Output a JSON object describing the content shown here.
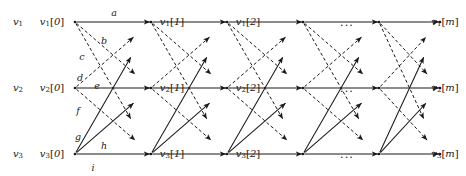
{
  "figure": {
    "type": "trellis-graph",
    "width": 466,
    "height": 176,
    "background": "#ffffff",
    "ink": "#1a1a1a"
  },
  "rows": [
    {
      "id": "v1",
      "y": 22,
      "name_label": "v",
      "name_sub": "1"
    },
    {
      "id": "v2",
      "y": 88,
      "name_label": "v",
      "name_sub": "2"
    },
    {
      "id": "v3",
      "y": 154,
      "name_label": "v",
      "name_sub": "3"
    }
  ],
  "row_names": [
    {
      "base": "v",
      "sub": "1",
      "x": 18,
      "y": 22
    },
    {
      "base": "v",
      "sub": "2",
      "x": 18,
      "y": 88
    },
    {
      "base": "v",
      "sub": "3",
      "x": 18,
      "y": 154
    }
  ],
  "stage_x": [
    75,
    151,
    227,
    303,
    379,
    440
  ],
  "columns": [
    {
      "time": "0",
      "x": 75
    },
    {
      "time": "1",
      "x": 151
    },
    {
      "time": "2",
      "x": 227
    },
    {
      "time": "m",
      "x": 440
    }
  ],
  "nodes": [
    {
      "base": "v",
      "sub": "1",
      "time": "0",
      "x": 52,
      "y": 22
    },
    {
      "base": "v",
      "sub": "2",
      "time": "0",
      "x": 52,
      "y": 88
    },
    {
      "base": "v",
      "sub": "3",
      "time": "0",
      "x": 52,
      "y": 154
    },
    {
      "base": "v",
      "sub": "1",
      "time": "1",
      "x": 172,
      "y": 22
    },
    {
      "base": "v",
      "sub": "2",
      "time": "1",
      "x": 172,
      "y": 88
    },
    {
      "base": "v",
      "sub": "3",
      "time": "1",
      "x": 172,
      "y": 154
    },
    {
      "base": "v",
      "sub": "1",
      "time": "2",
      "x": 248,
      "y": 22
    },
    {
      "base": "v",
      "sub": "2",
      "time": "2",
      "x": 248,
      "y": 88
    },
    {
      "base": "v",
      "sub": "3",
      "time": "2",
      "x": 248,
      "y": 154
    },
    {
      "base": "v",
      "sub": "1",
      "time": "m",
      "x": 445,
      "y": 22
    },
    {
      "base": "v",
      "sub": "2",
      "time": "m",
      "x": 445,
      "y": 88
    },
    {
      "base": "v",
      "sub": "3",
      "time": "m",
      "x": 445,
      "y": 154
    }
  ],
  "edge_labels": [
    {
      "text": "a",
      "x": 114,
      "y": 12
    },
    {
      "text": "b",
      "x": 104,
      "y": 40
    },
    {
      "text": "c",
      "x": 82,
      "y": 56
    },
    {
      "text": "d",
      "x": 80,
      "y": 77
    },
    {
      "text": "e",
      "x": 97,
      "y": 85
    },
    {
      "text": "f",
      "x": 78,
      "y": 110
    },
    {
      "text": "g",
      "x": 78,
      "y": 136
    },
    {
      "text": "h",
      "x": 104,
      "y": 145
    },
    {
      "text": "i",
      "x": 93,
      "y": 167
    }
  ],
  "ellipses": [
    {
      "text": "...",
      "x": 347,
      "y": 22
    },
    {
      "text": "...",
      "x": 347,
      "y": 88
    },
    {
      "text": "...",
      "x": 347,
      "y": 154
    }
  ],
  "edge_styles": {
    "solid": {
      "dash": "none",
      "width": 1.05
    },
    "dashed": {
      "dash": "3.2,2.4",
      "width": 1.0
    }
  },
  "stage_edge_pattern": [
    {
      "from_row": 0,
      "to_row": 0,
      "style": "solid",
      "note": "v1 -> v1 horizontal"
    },
    {
      "from_row": 1,
      "to_row": 1,
      "style": "solid",
      "note": "v2 -> v2 horizontal"
    },
    {
      "from_row": 2,
      "to_row": 2,
      "style": "solid",
      "note": "v3 -> v3 horizontal"
    },
    {
      "from_row": 2,
      "to_row": 0,
      "style": "solid",
      "note": "v3 -> v1 rising long"
    },
    {
      "from_row": 2,
      "to_row": 1,
      "style": "solid",
      "note": "v3 -> v2 rising short"
    },
    {
      "from_row": 0,
      "to_row": 1,
      "style": "dashed",
      "note": "v1 -> v2 falling short"
    },
    {
      "from_row": 0,
      "to_row": 2,
      "style": "dashed",
      "note": "v1 -> v3 falling long"
    },
    {
      "from_row": 1,
      "to_row": 2,
      "style": "dashed",
      "note": "v2 -> v3 falling short"
    },
    {
      "from_row": 1,
      "to_row": 0,
      "style": "dashed",
      "note": "v2 -> v1 rising short"
    }
  ]
}
